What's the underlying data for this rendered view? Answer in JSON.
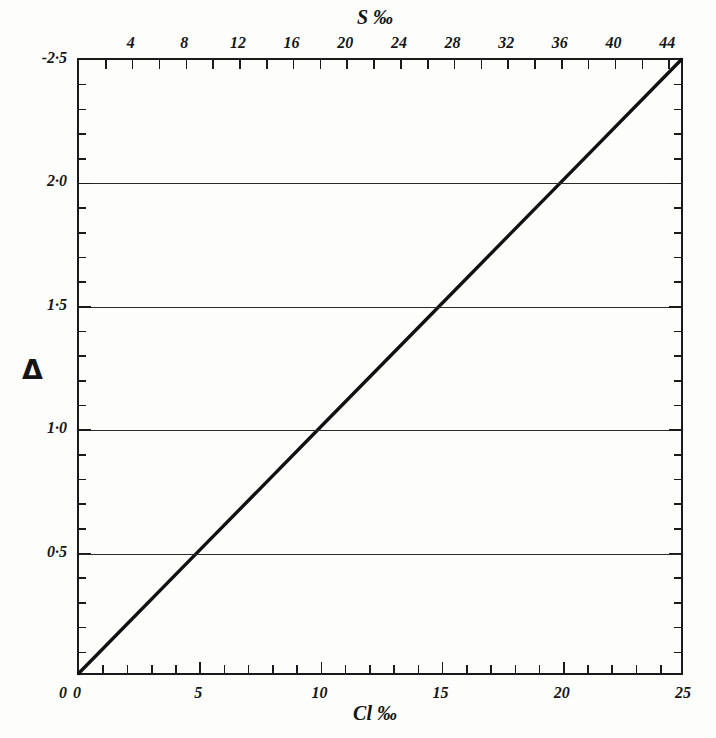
{
  "figure": {
    "background_color": "#fdfdfc",
    "ink_color": "#1a1a1a"
  },
  "chart_data": {
    "type": "line",
    "title": "",
    "subtitle": "",
    "xlabel": "Cl ‰",
    "ylabel": "Δ",
    "top_axis_label": "S ‰",
    "grid": true,
    "legend": null,
    "xlim": [
      0,
      25
    ],
    "ylim": [
      0,
      2.5
    ],
    "top_xlim": [
      0,
      45.18
    ],
    "x_major_ticks": [
      0,
      5,
      10,
      15,
      20,
      25
    ],
    "x_minor_step": 1,
    "x_tick_labels": [
      "0",
      "5",
      "10",
      "15",
      "20",
      "25"
    ],
    "y_major_ticks": [
      0,
      0.5,
      1.0,
      1.5,
      2.0,
      2.5
    ],
    "y_minor_step": 0.1,
    "y_tick_labels": [
      "0",
      "0·5",
      "1·0",
      "1·5",
      "2·0",
      "-2·5"
    ],
    "top_major_ticks": [
      4,
      8,
      12,
      16,
      20,
      24,
      28,
      32,
      36,
      40,
      44
    ],
    "top_minor_step": 2,
    "top_tick_labels": [
      "4",
      "8",
      "12",
      "16",
      "20",
      "24",
      "28",
      "32",
      "36",
      "40",
      "44"
    ],
    "gridline_values": [
      0.5,
      1.0,
      1.5,
      2.0
    ],
    "series": [
      {
        "name": "Δ vs Cl ‰",
        "x": [
          0,
          5,
          10,
          15,
          20,
          25
        ],
        "values": [
          0,
          0.5,
          1.0,
          1.5,
          2.0,
          2.5
        ],
        "line_color": "#111111",
        "line_width": 3.4
      }
    ]
  }
}
